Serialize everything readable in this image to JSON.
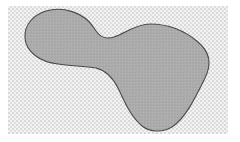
{
  "figure": {
    "colors": {
      "page_background": "#ffffff",
      "halftone_light": "#f2f2f2",
      "halftone_dark": "#d6d6d6",
      "blob_fill": "#acacac",
      "blob_stroke": "#4a4a4a"
    },
    "background_region": {
      "x": 8,
      "y": 6,
      "width": 220,
      "height": 128
    },
    "shape": {
      "name": "blob",
      "lobes": 2,
      "left_lobe_center": [
        55,
        38
      ],
      "right_lobe_center": [
        165,
        70
      ]
    }
  }
}
